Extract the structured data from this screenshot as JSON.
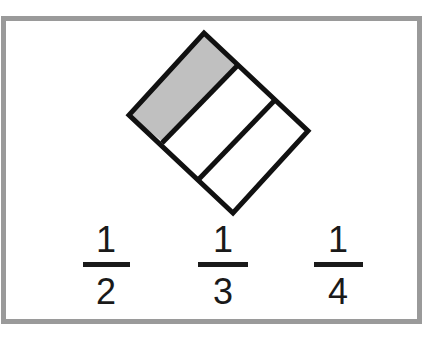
{
  "diagram": {
    "shape": {
      "type": "rotated-rectangle",
      "parts": 3,
      "shaded_parts": 1,
      "shade_color": "#c0c0c0",
      "stroke_color": "#111111"
    },
    "fractions": [
      {
        "numerator": "1",
        "denominator": "2"
      },
      {
        "numerator": "1",
        "denominator": "3"
      },
      {
        "numerator": "1",
        "denominator": "4"
      }
    ],
    "frame_color": "#9a9a9a"
  }
}
